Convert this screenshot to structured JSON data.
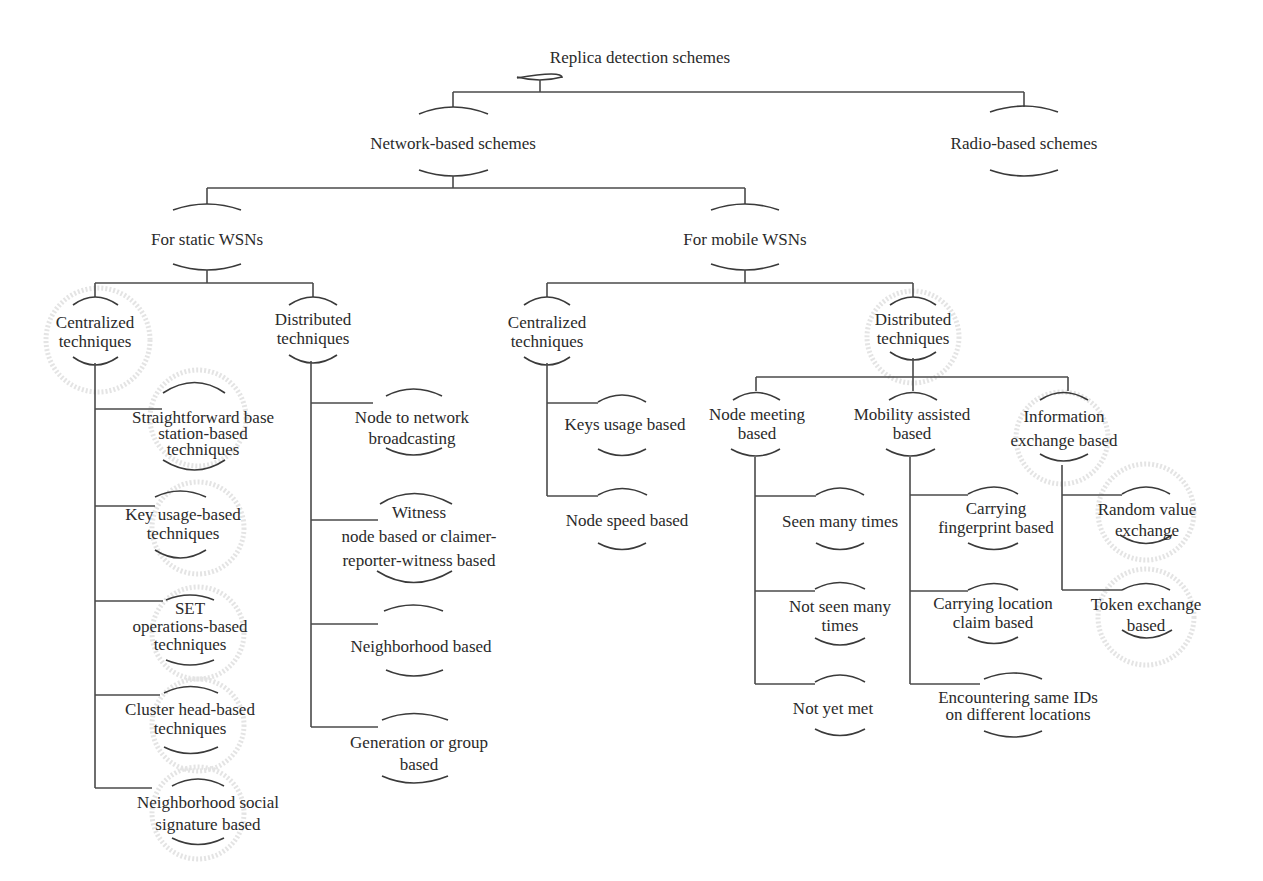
{
  "diagram": {
    "title": "Replica detection schemes",
    "colors": {
      "line": "#4a4a4a",
      "text": "#2a2a2a",
      "halo": "#e4e4e4",
      "background": "#ffffff"
    },
    "nodes": {
      "root": {
        "lines": [
          "Replica detection schemes"
        ]
      },
      "network": {
        "lines": [
          "Network-based schemes"
        ]
      },
      "radio": {
        "lines": [
          "Radio-based schemes"
        ]
      },
      "static": {
        "lines": [
          "For static WSNs"
        ]
      },
      "mobile": {
        "lines": [
          "For mobile WSNs"
        ]
      },
      "static_central": {
        "lines": [
          "Centralized",
          "techniques"
        ]
      },
      "static_distributed": {
        "lines": [
          "Distributed",
          "techniques"
        ]
      },
      "mobile_central": {
        "lines": [
          "Centralized",
          "techniques"
        ]
      },
      "mobile_distributed": {
        "lines": [
          "Distributed",
          "techniques"
        ]
      },
      "sc_1": {
        "lines": [
          "Straightforward base",
          "station-based",
          "techniques"
        ]
      },
      "sc_2": {
        "lines": [
          "Key usage-based",
          "techniques"
        ]
      },
      "sc_3": {
        "lines": [
          "SET",
          "operations-based",
          "techniques"
        ]
      },
      "sc_4": {
        "lines": [
          "Cluster head-based",
          "techniques"
        ]
      },
      "sc_5": {
        "lines": [
          "Neighborhood social",
          "signature based"
        ]
      },
      "sd_1": {
        "lines": [
          "Node to network",
          "broadcasting"
        ]
      },
      "sd_2": {
        "lines": [
          "Witness",
          "node based or claimer-",
          "reporter-witness based"
        ]
      },
      "sd_3": {
        "lines": [
          "Neighborhood based"
        ]
      },
      "sd_4": {
        "lines": [
          "Generation or group",
          "based"
        ]
      },
      "mc_1": {
        "lines": [
          "Keys usage based"
        ]
      },
      "mc_2": {
        "lines": [
          "Node speed based"
        ]
      },
      "md_meeting": {
        "lines": [
          "Node meeting",
          "based"
        ]
      },
      "md_mobility": {
        "lines": [
          "Mobility assisted",
          "based"
        ]
      },
      "md_info": {
        "lines": [
          "Information",
          "exchange based"
        ]
      },
      "nm_1": {
        "lines": [
          "Seen many times"
        ]
      },
      "nm_2": {
        "lines": [
          "Not seen many",
          "times"
        ]
      },
      "nm_3": {
        "lines": [
          "Not yet met"
        ]
      },
      "ma_1": {
        "lines": [
          "Carrying",
          "fingerprint based"
        ]
      },
      "ma_2": {
        "lines": [
          "Carrying location",
          "claim based"
        ]
      },
      "ma_3": {
        "lines": [
          "Encountering same IDs",
          "on different locations"
        ]
      },
      "ie_1": {
        "lines": [
          "Random value",
          "exchange"
        ]
      },
      "ie_2": {
        "lines": [
          "Token exchange",
          "based"
        ]
      }
    }
  }
}
